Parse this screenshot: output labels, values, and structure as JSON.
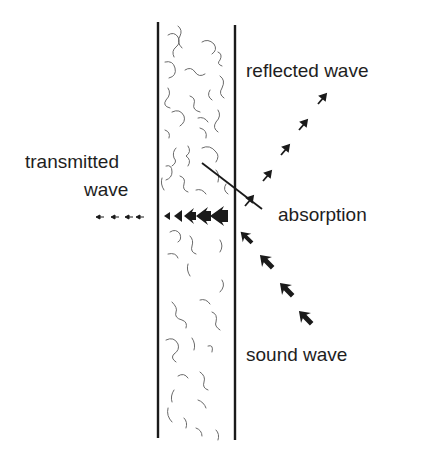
{
  "diagram": {
    "labels": {
      "reflected": "reflected wave",
      "transmitted_line1": "transmitted",
      "transmitted_line2": "wave",
      "absorption": "absorption",
      "sound": "sound wave"
    },
    "colors": {
      "ink": "#1a1a1a",
      "fibers": "#6a6a6a",
      "background": "#ffffff"
    }
  }
}
